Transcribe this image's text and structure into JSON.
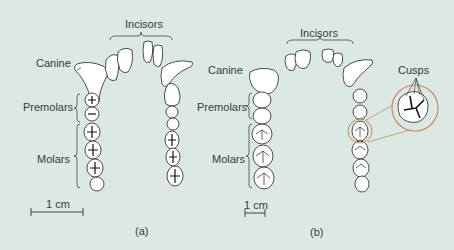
{
  "figure": {
    "background_color": "#dce8e4",
    "accent_color": "#c98a5e",
    "panels": [
      {
        "id": "a",
        "caption": "(a)",
        "labels": {
          "incisors": "Incisors",
          "canine": "Canine",
          "premolars": "Premolars",
          "molars": "Molars"
        },
        "scale_bar": "1 cm"
      },
      {
        "id": "b",
        "caption": "(b)",
        "labels": {
          "incisors": "Incisors",
          "canine": "Canine",
          "premolars": "Premolars",
          "molars": "Molars",
          "cusps": "Cusps"
        },
        "scale_bar": "1 cm"
      }
    ]
  }
}
